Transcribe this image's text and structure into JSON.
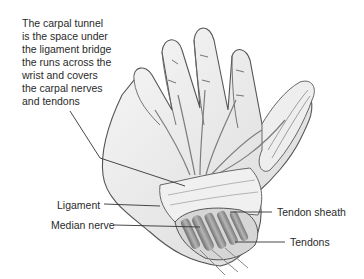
{
  "diagram": {
    "caption": "The carpal tunnel\nis the space under\nthe ligament bridge\nthe runs across the\nwrist and covers\nthe carpal nerves\nand tendons",
    "labels": [
      {
        "id": "ligament",
        "text": "Ligament"
      },
      {
        "id": "median-nerve",
        "text": "Median nerve"
      },
      {
        "id": "tendon-sheath",
        "text": "Tendon sheath"
      },
      {
        "id": "tendons",
        "text": "Tendons"
      }
    ],
    "colors": {
      "text": "#2a2a2a",
      "outline": "#555555",
      "shade": "#9a9a9a",
      "skin": "#f2f2f2",
      "tendon": "#8c8c8c"
    }
  }
}
